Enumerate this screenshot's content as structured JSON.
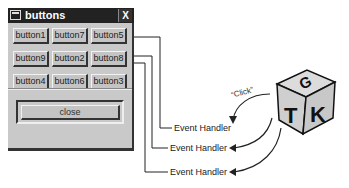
{
  "window": {
    "title": "buttons",
    "close_label": "X",
    "buttons": [
      [
        "button1",
        "button7",
        "button5"
      ],
      [
        "button9",
        "button2",
        "button8"
      ],
      [
        "button4",
        "button6",
        "button3"
      ]
    ],
    "close_button_label": "close"
  },
  "diagram": {
    "handlers": [
      "Event Handler",
      "Event Handler",
      "Event Handler"
    ],
    "click_label": "“Click”",
    "logo_letters": {
      "top": "G",
      "left": "T",
      "right": "K"
    }
  }
}
